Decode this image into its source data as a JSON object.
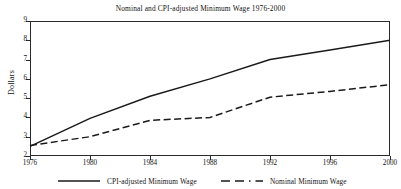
{
  "chart_data": {
    "type": "line",
    "title": "Nominal and CPI-adjusted Minimum Wage  1976-2000",
    "xlabel": "",
    "ylabel": "Dollars",
    "x": [
      1976,
      1980,
      1984,
      1988,
      1992,
      1996,
      2000
    ],
    "xticks": [
      "1976",
      "1980",
      "1984",
      "1988",
      "1992",
      "1996",
      "2000"
    ],
    "yticks": [
      "2",
      "3",
      "4",
      "5",
      "6",
      "7",
      "8",
      "9"
    ],
    "xlim": [
      1976,
      2000
    ],
    "ylim": [
      2,
      9
    ],
    "grid": true,
    "legend_position": "bottom",
    "series": [
      {
        "name": "CPI-adjusted Minimum Wage",
        "style": "solid",
        "color": "#1a1a1a",
        "values": [
          2.5,
          3.95,
          5.1,
          6.0,
          7.0,
          7.5,
          8.0
        ]
      },
      {
        "name": "Nominal Minimum Wage",
        "style": "dashed",
        "color": "#1a1a1a",
        "values": [
          2.55,
          3.0,
          3.85,
          4.0,
          5.05,
          5.35,
          5.7
        ]
      }
    ]
  },
  "legend": {
    "items": [
      {
        "label": "CPI-adjusted Minimum Wage"
      },
      {
        "label": "Nominal Minimum Wage"
      }
    ]
  }
}
